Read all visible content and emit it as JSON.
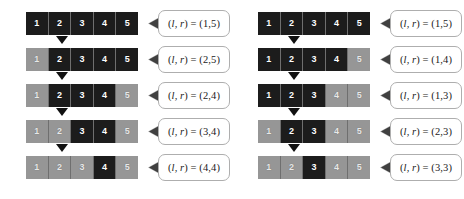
{
  "figure": {
    "cell_labels": [
      "1",
      "2",
      "3",
      "4",
      "5"
    ],
    "colors": {
      "active_cell": "#1c1c1c",
      "inactive_cell": "#969696",
      "cell_border": "#6f6f6f",
      "active_text": "#ffffff",
      "inactive_text": "#e8e8e8",
      "arrow": "#111111",
      "bubble_border": "#aeaeae",
      "bubble_fill": "#ffffff",
      "label_text": "#1a1a1a",
      "background": "#ffffff"
    },
    "columns": [
      {
        "name": "left-column",
        "rows": [
          {
            "cells": [
              {
                "label": "1",
                "state": "active"
              },
              {
                "label": "2",
                "state": "active"
              },
              {
                "label": "3",
                "state": "active"
              },
              {
                "label": "4",
                "state": "active"
              },
              {
                "label": "5",
                "state": "active"
              }
            ],
            "callout": {
              "prefix": "(",
              "l": "l",
              "sep": ", ",
              "r": "r",
              "suffix": ") = ",
              "value": "(1,5)",
              "full": "(l, r) = (1,5)"
            },
            "has_arrow": true
          },
          {
            "cells": [
              {
                "label": "1",
                "state": "inactive"
              },
              {
                "label": "2",
                "state": "active"
              },
              {
                "label": "3",
                "state": "active"
              },
              {
                "label": "4",
                "state": "active"
              },
              {
                "label": "5",
                "state": "active"
              }
            ],
            "callout": {
              "prefix": "(",
              "l": "l",
              "sep": ", ",
              "r": "r",
              "suffix": ") = ",
              "value": "(2,5)",
              "full": "(l, r) = (2,5)"
            },
            "has_arrow": true
          },
          {
            "cells": [
              {
                "label": "1",
                "state": "inactive"
              },
              {
                "label": "2",
                "state": "active"
              },
              {
                "label": "3",
                "state": "active"
              },
              {
                "label": "4",
                "state": "active"
              },
              {
                "label": "5",
                "state": "inactive"
              }
            ],
            "callout": {
              "prefix": "(",
              "l": "l",
              "sep": ", ",
              "r": "r",
              "suffix": ") = ",
              "value": "(2,4)",
              "full": "(l, r) = (2,4)"
            },
            "has_arrow": true
          },
          {
            "cells": [
              {
                "label": "1",
                "state": "inactive"
              },
              {
                "label": "2",
                "state": "inactive"
              },
              {
                "label": "3",
                "state": "active"
              },
              {
                "label": "4",
                "state": "active"
              },
              {
                "label": "5",
                "state": "inactive"
              }
            ],
            "callout": {
              "prefix": "(",
              "l": "l",
              "sep": ", ",
              "r": "r",
              "suffix": ") = ",
              "value": "(3,4)",
              "full": "(l, r) = (3,4)"
            },
            "has_arrow": true
          },
          {
            "cells": [
              {
                "label": "1",
                "state": "inactive"
              },
              {
                "label": "2",
                "state": "inactive"
              },
              {
                "label": "3",
                "state": "inactive"
              },
              {
                "label": "4",
                "state": "active"
              },
              {
                "label": "5",
                "state": "inactive"
              }
            ],
            "callout": {
              "prefix": "(",
              "l": "l",
              "sep": ", ",
              "r": "r",
              "suffix": ") = ",
              "value": "(4,4)",
              "full": "(l, r) = (4,4)"
            },
            "has_arrow": false
          }
        ]
      },
      {
        "name": "right-column",
        "rows": [
          {
            "cells": [
              {
                "label": "1",
                "state": "active"
              },
              {
                "label": "2",
                "state": "active"
              },
              {
                "label": "3",
                "state": "active"
              },
              {
                "label": "4",
                "state": "active"
              },
              {
                "label": "5",
                "state": "active"
              }
            ],
            "callout": {
              "prefix": "(",
              "l": "l",
              "sep": ", ",
              "r": "r",
              "suffix": ") = ",
              "value": "(1,5)",
              "full": "(l, r) = (1,5)"
            },
            "has_arrow": true
          },
          {
            "cells": [
              {
                "label": "1",
                "state": "active"
              },
              {
                "label": "2",
                "state": "active"
              },
              {
                "label": "3",
                "state": "active"
              },
              {
                "label": "4",
                "state": "active"
              },
              {
                "label": "5",
                "state": "inactive"
              }
            ],
            "callout": {
              "prefix": "(",
              "l": "l",
              "sep": ", ",
              "r": "r",
              "suffix": ") = ",
              "value": "(1,4)",
              "full": "(l, r) = (1,4)"
            },
            "has_arrow": true
          },
          {
            "cells": [
              {
                "label": "1",
                "state": "active"
              },
              {
                "label": "2",
                "state": "active"
              },
              {
                "label": "3",
                "state": "active"
              },
              {
                "label": "4",
                "state": "inactive"
              },
              {
                "label": "5",
                "state": "inactive"
              }
            ],
            "callout": {
              "prefix": "(",
              "l": "l",
              "sep": ", ",
              "r": "r",
              "suffix": ") = ",
              "value": "(1,3)",
              "full": "(l, r) = (1,3)"
            },
            "has_arrow": true
          },
          {
            "cells": [
              {
                "label": "1",
                "state": "inactive"
              },
              {
                "label": "2",
                "state": "active"
              },
              {
                "label": "3",
                "state": "active"
              },
              {
                "label": "4",
                "state": "inactive"
              },
              {
                "label": "5",
                "state": "inactive"
              }
            ],
            "callout": {
              "prefix": "(",
              "l": "l",
              "sep": ", ",
              "r": "r",
              "suffix": ") = ",
              "value": "(2,3)",
              "full": "(l, r) = (2,3)"
            },
            "has_arrow": true
          },
          {
            "cells": [
              {
                "label": "1",
                "state": "inactive"
              },
              {
                "label": "2",
                "state": "inactive"
              },
              {
                "label": "3",
                "state": "active"
              },
              {
                "label": "4",
                "state": "inactive"
              },
              {
                "label": "5",
                "state": "inactive"
              }
            ],
            "callout": {
              "prefix": "(",
              "l": "l",
              "sep": ", ",
              "r": "r",
              "suffix": ") = ",
              "value": "(3,3)",
              "full": "(l, r) = (3,3)"
            },
            "has_arrow": false
          }
        ]
      }
    ]
  }
}
